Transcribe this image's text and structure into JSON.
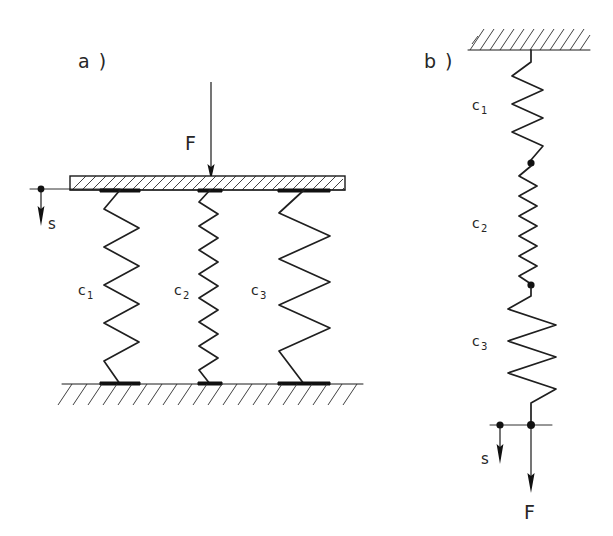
{
  "figure": {
    "title_panels": [
      {
        "id": "a",
        "label": "a )"
      },
      {
        "id": "b",
        "label": "b )"
      }
    ]
  },
  "panel_a": {
    "caption": "a )",
    "force_label": "F",
    "displacement_label": "s",
    "springs": [
      {
        "name": "spring-c1",
        "label": "c",
        "subscript": "1"
      },
      {
        "name": "spring-c2",
        "label": "c",
        "subscript": "2"
      },
      {
        "name": "spring-c3",
        "label": "c",
        "subscript": "3"
      }
    ],
    "plate": {
      "name": "rigid-plate",
      "hatched": true
    },
    "ground": {
      "name": "fixed-ground",
      "hatched": true
    }
  },
  "panel_b": {
    "caption": "b )",
    "force_label": "F",
    "displacement_label": "s",
    "springs": [
      {
        "name": "spring-c1",
        "label": "c",
        "subscript": "1"
      },
      {
        "name": "spring-c2",
        "label": "c",
        "subscript": "2"
      },
      {
        "name": "spring-c3",
        "label": "c",
        "subscript": "3"
      }
    ],
    "ceiling": {
      "name": "fixed-ceiling",
      "hatched": true
    }
  },
  "colors": {
    "ink": "#1a1a1a",
    "label_ink": "#262626",
    "background": "#ffffff"
  }
}
